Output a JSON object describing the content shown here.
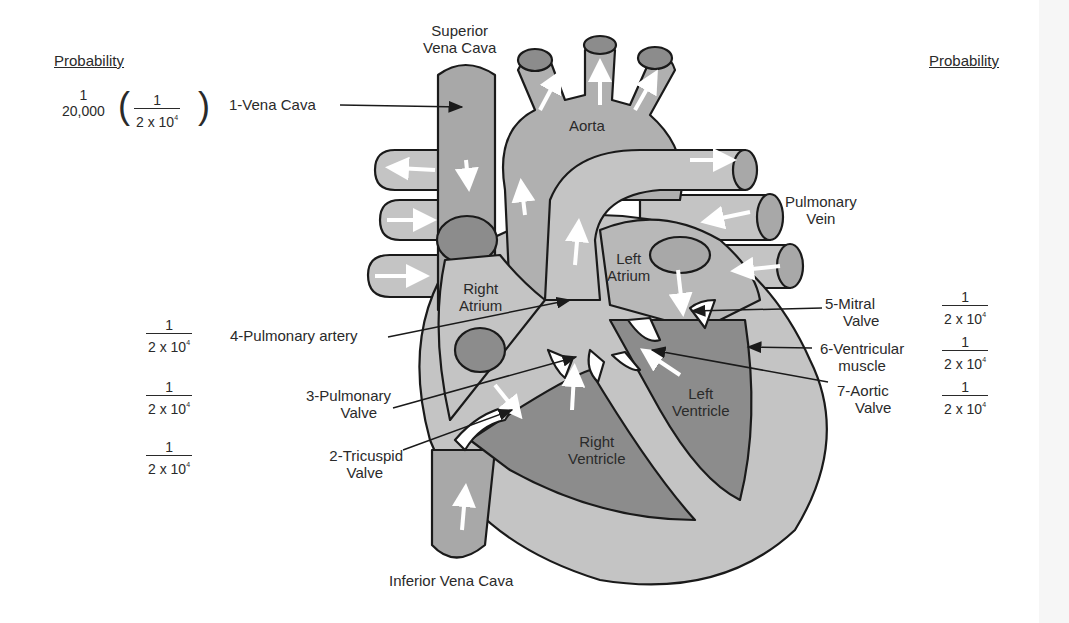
{
  "headings": {
    "left": "Probability",
    "right": "Probability"
  },
  "anatomy_labels": {
    "superior_vena_cava": [
      "Superior",
      "Vena Cava"
    ],
    "aorta": "Aorta",
    "pulmonary_vein": [
      "Pulmonary",
      "Vein"
    ],
    "right_atrium": [
      "Right",
      "Atrium"
    ],
    "left_atrium": [
      "Left",
      "Atrium"
    ],
    "right_ventricle": [
      "Right",
      "Ventricle"
    ],
    "left_ventricle": [
      "Left",
      "Ventricle"
    ],
    "inferior_vena_cava": "Inferior Vena Cava"
  },
  "components": [
    {
      "id": 1,
      "label": [
        "1-Vena Cava"
      ],
      "side": "left",
      "probability": {
        "num": "1",
        "den": "20,000",
        "alt_num": "1",
        "alt_den": "2 x 10",
        "alt_exp": "4"
      }
    },
    {
      "id": 4,
      "label": [
        "4-Pulmonary artery"
      ],
      "side": "left",
      "probability": {
        "num": "1",
        "den": "2 x 10",
        "exp": "4"
      }
    },
    {
      "id": 3,
      "label": [
        "3-Pulmonary",
        "Valve"
      ],
      "side": "left",
      "probability": {
        "num": "1",
        "den": "2 x 10",
        "exp": "4"
      }
    },
    {
      "id": 2,
      "label": [
        "2-Tricuspid",
        "Valve"
      ],
      "side": "left",
      "probability": {
        "num": "1",
        "den": "2 x 10",
        "exp": "4"
      }
    },
    {
      "id": 5,
      "label": [
        "5-Mitral",
        "Valve"
      ],
      "side": "right",
      "probability": {
        "num": "1",
        "den": "2 x 10",
        "exp": "4"
      }
    },
    {
      "id": 6,
      "label": [
        "6-Ventricular",
        "muscle"
      ],
      "side": "right",
      "probability": {
        "num": "1",
        "den": "2 x 10",
        "exp": "4"
      }
    },
    {
      "id": 7,
      "label": [
        "7-Aortic",
        "Valve"
      ],
      "side": "right",
      "probability": {
        "num": "1",
        "den": "2 x 10",
        "exp": "4"
      }
    }
  ],
  "colors": {
    "outline": "#1a1a1a",
    "light_gray": "#c4c4c4",
    "mid_gray": "#a8a8a8",
    "dark_gray": "#8c8c8c",
    "flow_arrow": "#ffffff",
    "text": "#2a2a2a"
  }
}
